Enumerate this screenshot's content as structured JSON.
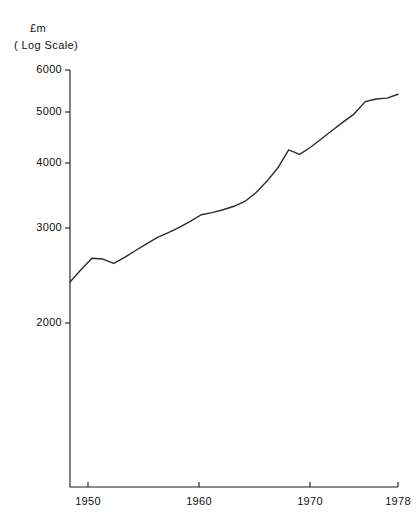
{
  "labels": {
    "unit": "£m",
    "scale": "( Log Scale)"
  },
  "chart_data": {
    "type": "line",
    "title": "",
    "subtitle": "",
    "xlabel": "",
    "ylabel": "£m ( Log Scale)",
    "yscale": "log",
    "grid": false,
    "legend": "none",
    "ylim": [
      1700,
      6400
    ],
    "xlim": [
      1948,
      1978
    ],
    "ytick_labels": [
      "6000",
      "5000",
      "4000",
      "3000",
      "2000"
    ],
    "yticks": [
      6000,
      5000,
      4000,
      3000,
      2000
    ],
    "xtick_labels": [
      "1950",
      "1960",
      "1970",
      "1978"
    ],
    "xticks": [
      1950,
      1960,
      1970,
      1978
    ],
    "series": [
      {
        "name": "",
        "x": [
          1948,
          1949,
          1950,
          1951,
          1952,
          1953,
          1954,
          1955,
          1956,
          1957,
          1958,
          1959,
          1960,
          1961,
          1962,
          1963,
          1964,
          1965,
          1966,
          1967,
          1968,
          1969,
          1970,
          1971,
          1972,
          1973,
          1974,
          1975,
          1976,
          1977,
          1978
        ],
        "values": [
          2390,
          2520,
          2650,
          2640,
          2590,
          2660,
          2740,
          2820,
          2900,
          2960,
          3030,
          3110,
          3200,
          3230,
          3270,
          3320,
          3390,
          3520,
          3700,
          3920,
          4240,
          4160,
          4290,
          4450,
          4620,
          4790,
          4960,
          5230,
          5290,
          5310,
          5400
        ]
      }
    ]
  },
  "geometry": {
    "axis_left_px": 70,
    "axis_bottom_px": 487,
    "axis_top_px": 70,
    "axis_right_px": 398,
    "ytick_px": [
      70,
      112,
      163,
      228,
      323
    ],
    "xtick_px": [
      88,
      199,
      310,
      398
    ]
  }
}
